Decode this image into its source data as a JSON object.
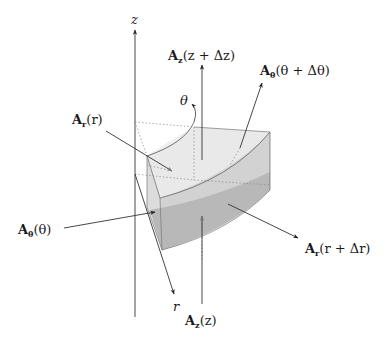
{
  "figure": {
    "colors": {
      "background": "#ffffff",
      "line": "#333333",
      "face_light": "#ededed",
      "face_mid": "#d6d6d6",
      "face_dark": "#b3b3b3",
      "dotted": "#888888"
    },
    "axes": {
      "z": "z",
      "r": "r",
      "theta": "θ"
    },
    "labels": {
      "Az_top": {
        "base": "A",
        "sub": "z",
        "arg": "(z + Δz)"
      },
      "Atheta_top": {
        "base": "A",
        "sub": "θ",
        "arg": "(θ + Δθ)"
      },
      "Ar_left": {
        "base": "A",
        "sub": "r",
        "arg": "(r)"
      },
      "Atheta_left": {
        "base": "A",
        "sub": "θ",
        "arg": "(θ)"
      },
      "Ar_right": {
        "base": "A",
        "sub": "r",
        "arg": "(r + Δr)"
      },
      "Az_bottom": {
        "base": "A",
        "sub": "z",
        "arg": "(z)"
      }
    }
  }
}
